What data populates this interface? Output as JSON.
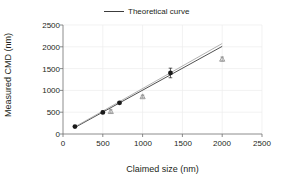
{
  "chart_data": {
    "type": "scatter",
    "title": "",
    "xlabel": "Claimed size (nm)",
    "ylabel": "Measured CMD (nm)",
    "xlim": [
      0,
      2500
    ],
    "ylim": [
      0,
      2500
    ],
    "xticks": [
      0,
      500,
      1000,
      1500,
      2000,
      2500
    ],
    "yticks": [
      0,
      500,
      1000,
      1500,
      2000,
      2500
    ],
    "xtick_labels": [
      "0",
      "500",
      "1000",
      "1500",
      "2000",
      "2500"
    ],
    "ytick_labels": [
      "0",
      "500",
      "1000",
      "1500",
      "2000",
      "2500"
    ],
    "grid": true,
    "legend_position": "top-center",
    "legend": [
      {
        "label": "Theoretical curve",
        "marker": "line",
        "color": "#3c3c3c"
      }
    ],
    "series": [
      {
        "name": "Measured CMD (circles)",
        "marker": "circle",
        "color": "#1a1a1a",
        "points": [
          {
            "x": 150,
            "y": 170,
            "yerr": 0
          },
          {
            "x": 500,
            "y": 495,
            "yerr": 25
          },
          {
            "x": 710,
            "y": 715,
            "yerr": 20
          },
          {
            "x": 1350,
            "y": 1400,
            "yerr": 110
          }
        ]
      },
      {
        "name": "Measured CMD (triangles)",
        "marker": "triangle",
        "color": "#8c8c8c",
        "points": [
          {
            "x": 600,
            "y": 520,
            "yerr": 35
          },
          {
            "x": 1000,
            "y": 860,
            "yerr": 30
          },
          {
            "x": 2000,
            "y": 1720,
            "yerr": 45
          }
        ]
      }
    ],
    "lines": [
      {
        "name": "Theoretical curve",
        "color": "#3c3c3c",
        "x": [
          150,
          2000
        ],
        "y": [
          150,
          2010
        ]
      },
      {
        "name": "Fitted trend",
        "color": "#a0a0a0",
        "x": [
          150,
          2000
        ],
        "y": [
          165,
          2075
        ]
      }
    ]
  }
}
